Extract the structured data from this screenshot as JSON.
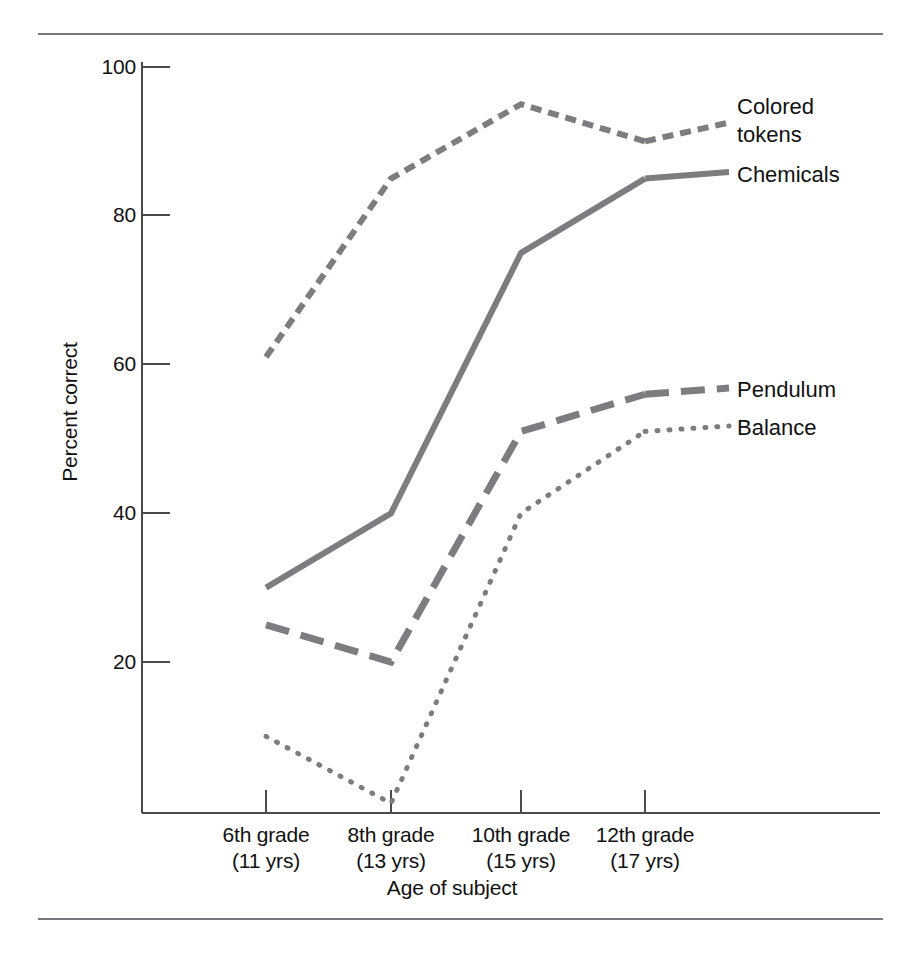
{
  "figure": {
    "has_top_rule": true,
    "has_bottom_rule": true,
    "rule_color": "#77797c",
    "line_color": "#7b7d80",
    "axis_color": "#4a4a4a",
    "text_color": "#111111"
  },
  "chart_data": {
    "type": "line",
    "title": "",
    "xlabel": "Age of subject",
    "ylabel": "Percent correct",
    "categories": [
      "6th grade\n(11 yrs)",
      "8th grade\n(13 yrs)",
      "10th grade\n(15 yrs)",
      "12th grade\n(17 yrs)"
    ],
    "category_lines": [
      [
        "6th grade",
        "(11 yrs)"
      ],
      [
        "8th grade",
        "(13 yrs)"
      ],
      [
        "10th grade",
        "(15 yrs)"
      ],
      [
        "12th grade",
        "(17 yrs)"
      ]
    ],
    "yticks": [
      20,
      40,
      60,
      80,
      100
    ],
    "ytick_labels": [
      "20",
      "40",
      "60",
      "80",
      "100"
    ],
    "ylim": [
      0,
      100
    ],
    "grid": false,
    "legend_position": "right-of-line-ends",
    "series": [
      {
        "name": "Colored tokens",
        "label_lines": [
          "Colored",
          "tokens"
        ],
        "style": "short-dash",
        "values": [
          61,
          85,
          95,
          90
        ]
      },
      {
        "name": "Chemicals",
        "label_lines": [
          "Chemicals"
        ],
        "style": "solid",
        "values": [
          30,
          40,
          75,
          85
        ]
      },
      {
        "name": "Pendulum",
        "label_lines": [
          "Pendulum"
        ],
        "style": "long-dash",
        "values": [
          25,
          20,
          51,
          56
        ]
      },
      {
        "name": "Balance",
        "label_lines": [
          "Balance"
        ],
        "style": "dotted",
        "values": [
          10,
          1,
          40,
          51
        ]
      }
    ]
  },
  "axes": {
    "y_tick_0": "100",
    "y_tick_1": "80",
    "y_tick_2": "60",
    "y_tick_3": "40",
    "y_tick_4": "20",
    "y_axis_title": "Percent correct",
    "x_axis_title": "Age of subject",
    "x_tick_0_line1": "6th grade",
    "x_tick_0_line2": "(11 yrs)",
    "x_tick_1_line1": "8th grade",
    "x_tick_1_line2": "(13 yrs)",
    "x_tick_2_line1": "10th grade",
    "x_tick_2_line2": "(15 yrs)",
    "x_tick_3_line1": "12th grade",
    "x_tick_3_line2": "(17 yrs)"
  },
  "series_labels": {
    "colored_tokens_line1": "Colored",
    "colored_tokens_line2": "tokens",
    "chemicals": "Chemicals",
    "pendulum": "Pendulum",
    "balance": "Balance"
  }
}
